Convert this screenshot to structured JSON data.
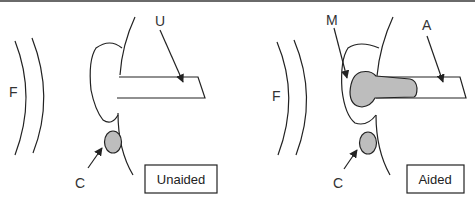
{
  "figure": {
    "panels": [
      {
        "id": "unaided",
        "caption": "Unaided",
        "labels": {
          "F": "F",
          "U": "U",
          "C": "C"
        }
      },
      {
        "id": "aided",
        "caption": "Aided",
        "labels": {
          "F": "F",
          "M": "M",
          "A": "A",
          "C": "C"
        }
      }
    ],
    "colors": {
      "stroke": "#222222",
      "fill_gray": "#bdbdbd",
      "top_border": "#6a6a6a"
    }
  }
}
